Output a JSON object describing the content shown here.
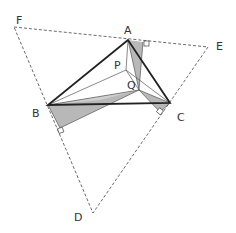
{
  "diagram": {
    "points": {
      "A": {
        "label": "A",
        "x": 128,
        "y": 40
      },
      "B": {
        "label": "B",
        "x": 48,
        "y": 105
      },
      "C": {
        "label": "C",
        "x": 170,
        "y": 103
      },
      "P": {
        "label": "P",
        "x": 126,
        "y": 70
      },
      "Q": {
        "label": "Q",
        "x": 139,
        "y": 90
      },
      "D": {
        "label": "D",
        "x": 93,
        "y": 213
      },
      "E": {
        "label": "E",
        "x": 208,
        "y": 47
      },
      "F": {
        "label": "F",
        "x": 14,
        "y": 27
      }
    },
    "labels": {
      "A": "A",
      "B": "B",
      "C": "C",
      "D": "D",
      "E": "E",
      "F": "F",
      "P": "P",
      "Q": "Q"
    },
    "colors": {
      "shade": "#b8b8b8",
      "stroke": "#222222",
      "dashed": "#444444"
    }
  }
}
